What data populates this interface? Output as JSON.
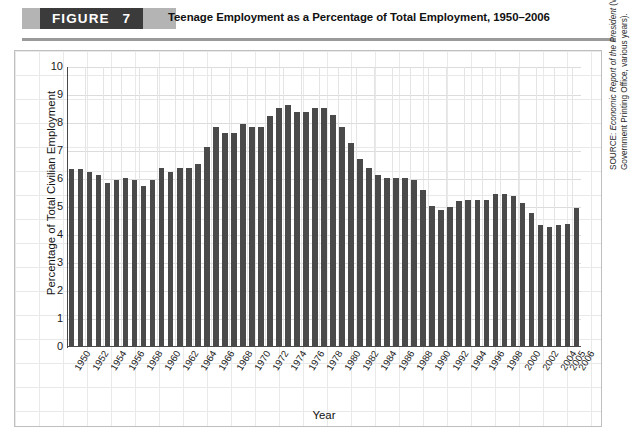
{
  "figure": {
    "banner_word": "FIGURE",
    "banner_number": "7",
    "title": "Teenage Employment as a Percentage of Total Employment, 1950–2006"
  },
  "source": {
    "prefix": "SOURCE: ",
    "italic_part": "Economic Report of the President",
    "rest": " (Washington, DC: U.S. Government Printing Office, various years).",
    "full": "SOURCE: Economic Report of the President (Washington, DC: U.S. Government Printing Office, various years)."
  },
  "chart_data": {
    "type": "bar",
    "title": "Teenage Employment as a Percentage of Total Employment, 1950–2006",
    "xlabel": "Year",
    "ylabel": "Percentage of Total Civilian Employment",
    "ylim": [
      0,
      10
    ],
    "ytick_labels": [
      "0",
      "1",
      "2",
      "3",
      "4",
      "5",
      "6",
      "7",
      "8",
      "9",
      "10"
    ],
    "ytick_values": [
      0,
      1,
      2,
      3,
      4,
      5,
      6,
      7,
      8,
      9,
      10
    ],
    "grid": true,
    "legend": null,
    "bar_color": "#4a4a4a",
    "grid_color": "#dcdcdc",
    "xtick_labels": [
      "1950",
      "1952",
      "1954",
      "1956",
      "1958",
      "1960",
      "1962",
      "1964",
      "1966",
      "1968",
      "1970",
      "1972",
      "1974",
      "1976",
      "1978",
      "1980",
      "1982",
      "1984",
      "1986",
      "1988",
      "1990",
      "1992",
      "1994",
      "1996",
      "1998",
      "2000",
      "2002",
      "2004",
      "2005",
      "2006"
    ],
    "categories": [
      "1950",
      "1951",
      "1952",
      "1953",
      "1954",
      "1955",
      "1956",
      "1957",
      "1958",
      "1959",
      "1960",
      "1961",
      "1962",
      "1963",
      "1964",
      "1965",
      "1966",
      "1967",
      "1968",
      "1969",
      "1970",
      "1971",
      "1972",
      "1973",
      "1974",
      "1975",
      "1976",
      "1977",
      "1978",
      "1979",
      "1980",
      "1981",
      "1982",
      "1983",
      "1984",
      "1985",
      "1986",
      "1987",
      "1988",
      "1989",
      "1990",
      "1991",
      "1992",
      "1993",
      "1994",
      "1995",
      "1996",
      "1997",
      "1998",
      "1999",
      "2000",
      "2001",
      "2002",
      "2003",
      "2004",
      "2005",
      "2006"
    ],
    "values": [
      6.35,
      6.35,
      6.25,
      6.15,
      5.85,
      5.95,
      6.05,
      5.95,
      5.75,
      5.95,
      6.4,
      6.25,
      6.4,
      6.4,
      6.55,
      7.15,
      7.85,
      7.65,
      7.65,
      7.95,
      7.85,
      7.85,
      8.25,
      8.55,
      8.65,
      8.4,
      8.4,
      8.55,
      8.55,
      8.3,
      7.85,
      7.3,
      6.7,
      6.4,
      6.15,
      6.05,
      6.05,
      6.05,
      5.95,
      5.6,
      5.05,
      4.9,
      5.0,
      5.2,
      5.25,
      5.25,
      5.25,
      5.45,
      5.45,
      5.4,
      5.15,
      4.8,
      4.35,
      4.3,
      4.35,
      4.4,
      4.95
    ]
  }
}
